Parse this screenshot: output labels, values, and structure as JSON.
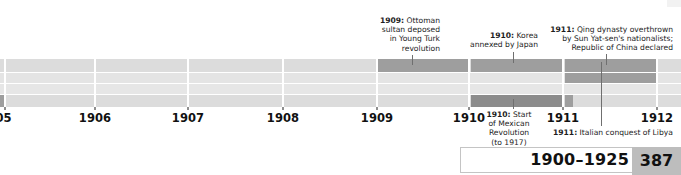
{
  "page": {
    "background": "#ffffff"
  },
  "axis": {
    "label": "Years",
    "ticks": [
      {
        "year": "1905",
        "display": "05",
        "x": 5,
        "clipped": true
      },
      {
        "year": "1906",
        "display": "1906",
        "x": 95,
        "clipped": false
      },
      {
        "year": "1907",
        "display": "1907",
        "x": 188,
        "clipped": false
      },
      {
        "year": "1908",
        "display": "1908",
        "x": 283,
        "clipped": false
      },
      {
        "year": "1909",
        "display": "1909",
        "x": 377,
        "clipped": false
      },
      {
        "year": "1910",
        "display": "1910",
        "x": 469,
        "clipped": false
      },
      {
        "year": "1911",
        "display": "1911",
        "x": 563,
        "clipped": false
      },
      {
        "year": "1912",
        "display": "1912",
        "x": 657,
        "clipped": false
      }
    ],
    "tick_color": "#8e8e8e"
  },
  "bands": {
    "row_light": "#dcdcdc",
    "row_light_alt": "#e4e4e4",
    "row_dark": "#9e9e9e",
    "row_dark_strong": "#8c8c8c",
    "gap": "#ffffff",
    "rows": [
      {
        "name": "row-1",
        "top": 0,
        "height": 13,
        "base_color": "#dcdcdc",
        "segments": [
          {
            "x": 377,
            "width": 92,
            "color": "#9e9e9e"
          },
          {
            "x": 471,
            "width": 92,
            "color": "#9e9e9e"
          },
          {
            "x": 565,
            "width": 92,
            "color": "#9e9e9e"
          }
        ]
      },
      {
        "name": "row-2",
        "top": 14,
        "height": 10,
        "base_color": "#e4e4e4",
        "segments": [
          {
            "x": 565,
            "width": 92,
            "color": "#9e9e9e"
          }
        ]
      },
      {
        "name": "row-3",
        "top": 25,
        "height": 10,
        "base_color": "#e6e6e6",
        "segments": []
      },
      {
        "name": "row-4",
        "top": 36,
        "height": 12,
        "base_color": "#dcdcdc",
        "segments": [
          {
            "x": 0,
            "width": 5,
            "color": "#9e9e9e"
          },
          {
            "x": 471,
            "width": 92,
            "color": "#8c8c8c"
          },
          {
            "x": 565,
            "width": 8,
            "color": "#9e9e9e"
          }
        ]
      }
    ],
    "column_rules": [
      5,
      95,
      188,
      283,
      377,
      469,
      563,
      657
    ]
  },
  "callouts": [
    {
      "id": "ottoman-1909",
      "year": "1909",
      "text": "1909: Ottoman\nsultan deposed\nin Young Turk\nrevolution",
      "bold_prefix": "1909:",
      "align": "right",
      "left": 358,
      "top": 16,
      "width": 82,
      "leader": {
        "x": 412,
        "top": 55,
        "height": 10
      }
    },
    {
      "id": "korea-1910",
      "year": "1910",
      "text": "1910: Korea\nannexed by Japan",
      "bold_prefix": "1910:",
      "align": "right",
      "left": 440,
      "top": 31,
      "width": 98,
      "leader": {
        "x": 513,
        "top": 52,
        "height": 11
      }
    },
    {
      "id": "qing-1911",
      "year": "1911",
      "text": "1911: Qing dynasty overthrown\nby Sun Yat-sen's nationalists;\nRepublic of China declared",
      "bold_prefix": "1911:",
      "align": "right",
      "left": 540,
      "top": 25,
      "width": 133,
      "leader": {
        "x": 606,
        "top": 54,
        "height": 11
      }
    },
    {
      "id": "mexico-1910",
      "year": "1910",
      "text": "1910: Start\nof Mexican\nRevolution\n(to 1917)",
      "bold_prefix": "1910:",
      "align": "center",
      "left": 479,
      "top": 110,
      "width": 60,
      "leader": {
        "x": 513,
        "top": 99,
        "height": 10
      }
    },
    {
      "id": "libya-1911",
      "year": "1911",
      "text": "1911: Italian conquest of Libya",
      "bold_prefix": "1911:",
      "align": "left",
      "left": 553,
      "top": 128,
      "width": 120,
      "leader": {
        "x": 601,
        "top": 62,
        "height": 64
      }
    }
  ],
  "footer": {
    "range": "1900–1925",
    "page_number": "387",
    "page_bg": "#bdbdbd",
    "border_color": "#c4c4c4"
  }
}
